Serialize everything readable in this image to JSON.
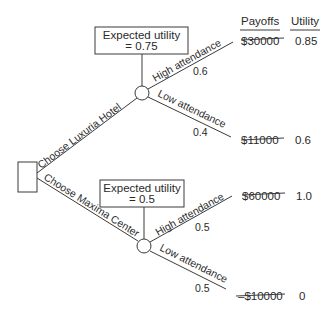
{
  "diagram": {
    "type": "decision-tree",
    "headers": {
      "payoffs": "Payoffs",
      "utility": "Utility"
    },
    "decision_node": {
      "shape": "square"
    },
    "alternatives": [
      {
        "label": "Choose Luxuria Hotel",
        "expected_utility_line1": "Expected utility",
        "expected_utility_line2": "= 0.75",
        "outcomes": [
          {
            "label": "High attendance",
            "probability": "0.6",
            "payoff": "$30000",
            "utility": "0.85"
          },
          {
            "label": "Low attendance",
            "probability": "0.4",
            "payoff": "$11000",
            "utility": "0.6"
          }
        ]
      },
      {
        "label": "Choose Maxima Center",
        "expected_utility_line1": "Expected utility",
        "expected_utility_line2": "= 0.5",
        "outcomes": [
          {
            "label": "High attendance",
            "probability": "0.5",
            "payoff": "$60000",
            "utility": "1.0"
          },
          {
            "label": "Low attendance",
            "probability": "0.5",
            "payoff": "–$10000",
            "utility": "0"
          }
        ]
      }
    ]
  }
}
